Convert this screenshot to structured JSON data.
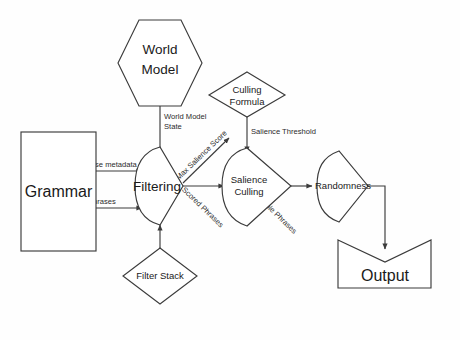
{
  "diagram": {
    "background": "#ffffff",
    "stroke_color": "#3b3b3b",
    "text_color": "#1a1a1a",
    "nodes": [
      {
        "id": "world-model",
        "label_line1": "World",
        "label_line2": "Model",
        "shape": "hexagon"
      },
      {
        "id": "grammar",
        "label_line1": "Grammar",
        "label_line2": "",
        "shape": "rectangle"
      },
      {
        "id": "filtering",
        "label_line1": "Filtering",
        "label_line2": "",
        "shape": "delay-funnel"
      },
      {
        "id": "filter-stack",
        "label_line1": "Filter Stack",
        "label_line2": "",
        "shape": "diamond"
      },
      {
        "id": "culling-formula",
        "label_line1": "Culling",
        "label_line2": "Formula",
        "shape": "diamond"
      },
      {
        "id": "salience-culling",
        "label_line1": "Salience",
        "label_line2": "Culling",
        "shape": "delay-funnel"
      },
      {
        "id": "randomness",
        "label_line1": "Randomness",
        "label_line2": "",
        "shape": "delay-funnel"
      },
      {
        "id": "output",
        "label_line1": "Output",
        "label_line2": "",
        "shape": "manual-input"
      }
    ],
    "edges": [
      {
        "id": "world-model-state",
        "label": "World Model",
        "label2": "State",
        "from": "world-model",
        "to": "filtering"
      },
      {
        "id": "phrase-metadata",
        "label": "Phrase metadata",
        "label2": "",
        "from": "grammar",
        "to": "filtering"
      },
      {
        "id": "phrases",
        "label": "Phrases",
        "label2": "",
        "from": "grammar",
        "to": "filtering"
      },
      {
        "id": "filter-stack-edge",
        "label": "",
        "label2": "",
        "from": "filter-stack",
        "to": "filtering"
      },
      {
        "id": "max-salience-score",
        "label": "Max Salience Score",
        "label2": "",
        "from": "filtering",
        "to": "culling-formula"
      },
      {
        "id": "salience-threshold",
        "label": "Salience Threshold",
        "label2": "",
        "from": "culling-formula",
        "to": "salience-culling"
      },
      {
        "id": "scored-phrases",
        "label": "Scored Phrases",
        "label2": "",
        "from": "filtering",
        "to": "salience-culling"
      },
      {
        "id": "available-phrases",
        "label": "Available Phrases",
        "label2": "",
        "from": "salience-culling",
        "to": "randomness"
      },
      {
        "id": "randomness-to-output",
        "label": "",
        "label2": "",
        "from": "randomness",
        "to": "output"
      }
    ]
  }
}
